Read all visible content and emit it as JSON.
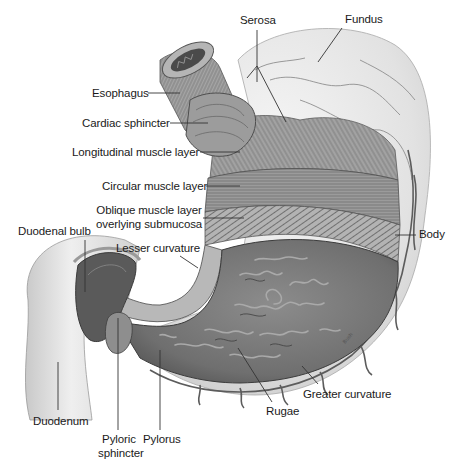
{
  "diagram": {
    "style": "grayscale medical illustration",
    "colors": {
      "background": "#ffffff",
      "serosa_fill": "#e4e4e4",
      "muscle_fill": "#9a9a9a",
      "muscle_dark": "#6e6e6e",
      "mucosa_fill": "#7a7a7a",
      "mucosa_dark": "#4a4a4a",
      "duodenum_fill": "#dcdcdc",
      "vessel": "#5a5a5a",
      "leader_line": "#333333",
      "text": "#1a1a1a"
    },
    "labels": {
      "serosa": "Serosa",
      "fundus": "Fundus",
      "esophagus": "Esophagus",
      "cardiac_sphincter": "Cardiac sphincter",
      "longitudinal_muscle": "Longitudinal muscle layer",
      "circular_muscle": "Circular muscle layer",
      "oblique_muscle_line1": "Oblique muscle layer",
      "oblique_muscle_line2": "overlying submucosa",
      "duodenal_bulb": "Duodenal bulb",
      "lesser_curvature": "Lesser curvature",
      "body": "Body",
      "duodenum": "Duodenum",
      "pyloric_sphincter_line1": "Pyloric",
      "pyloric_sphincter_line2": "sphincter",
      "pylorus": "Pylorus",
      "greater_curvature": "Greater curvature",
      "rugae": "Rugae"
    },
    "artist_signature": "Bush"
  }
}
